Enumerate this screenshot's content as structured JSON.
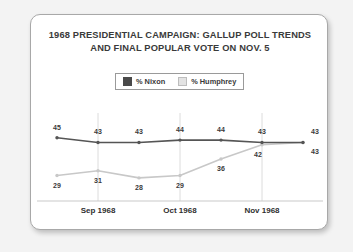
{
  "card": {
    "title_line1": "1968 PRESIDENTIAL CAMPAIGN: GALLUP POLL TRENDS",
    "title_line2": "AND FINAL POPULAR VOTE ON NOV. 5"
  },
  "legend": {
    "position": "top-center",
    "items": [
      {
        "label": "% Nixon",
        "color": "#4a4a4a",
        "swatch_name": "legend-swatch-nixon"
      },
      {
        "label": "% Humphrey",
        "color": "#e3e3e3",
        "swatch_name": "legend-swatch-humphrey"
      }
    ]
  },
  "chart_data": {
    "type": "line",
    "title": "1968 PRESIDENTIAL CAMPAIGN: GALLUP POLL TRENDS AND FINAL POPULAR VOTE ON NOV. 5",
    "xlabel": "",
    "ylabel": "",
    "ylim": [
      25,
      47
    ],
    "grid": "vertical-only",
    "legend_position": "top-center",
    "x": [
      0,
      1,
      2,
      3,
      4,
      5,
      6
    ],
    "tick_labels": [
      "Sep 1968",
      "Oct 1968",
      "Nov 1968"
    ],
    "tick_positions": [
      1,
      3,
      5
    ],
    "series": [
      {
        "name": "% Nixon",
        "color": "#555555",
        "values": [
          45,
          43,
          43,
          44,
          44,
          43,
          43
        ],
        "labels": [
          "45",
          "43",
          "43",
          "44",
          "44",
          "43",
          "43"
        ]
      },
      {
        "name": "% Humphrey",
        "color": "#c8c8c8",
        "values": [
          29,
          31,
          28,
          29,
          36,
          42,
          43
        ],
        "labels": [
          "29",
          "31",
          "28",
          "29",
          "36",
          "42",
          "43"
        ]
      }
    ]
  }
}
